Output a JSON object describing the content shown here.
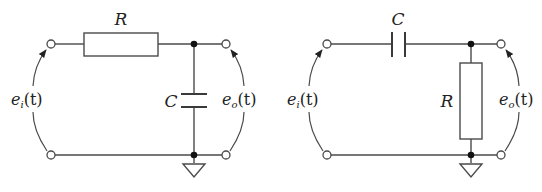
{
  "figure": {
    "circuits": [
      {
        "id": "low-pass",
        "series_component": {
          "type": "resistor",
          "label": "R"
        },
        "shunt_component": {
          "type": "capacitor",
          "label": "C"
        },
        "input_label": {
          "base": "e",
          "sub": "i",
          "arg": "(t)"
        },
        "output_label": {
          "base": "e",
          "sub": "o",
          "arg": "(t)"
        },
        "ground": true
      },
      {
        "id": "high-pass",
        "series_component": {
          "type": "capacitor",
          "label": "C"
        },
        "shunt_component": {
          "type": "resistor",
          "label": "R"
        },
        "input_label": {
          "base": "e",
          "sub": "i",
          "arg": "(t)"
        },
        "output_label": {
          "base": "e",
          "sub": "o",
          "arg": "(t)"
        },
        "ground": true
      }
    ]
  }
}
